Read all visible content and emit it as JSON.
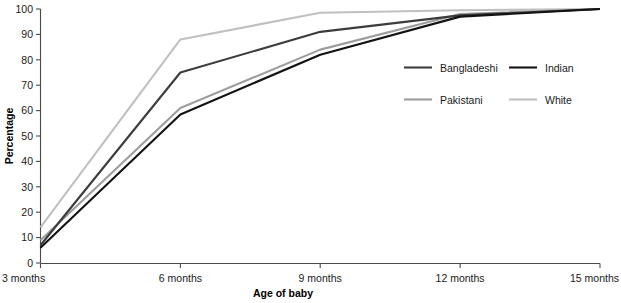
{
  "chart_data": {
    "type": "line",
    "title": "",
    "xlabel": "Age of baby",
    "ylabel": "Percentage",
    "x": [
      "3 months",
      "6 months",
      "9 months",
      "12 months",
      "15 months"
    ],
    "categories": [
      "3 months",
      "6 months",
      "9 months",
      "12 months",
      "15 months"
    ],
    "xtick_labels": [
      "3 months",
      "6 months",
      "9 months",
      "12 months",
      "15 months"
    ],
    "ytick_labels": [
      "0",
      "10",
      "20",
      "30",
      "40",
      "50",
      "60",
      "70",
      "80",
      "90",
      "100"
    ],
    "ylim": [
      0,
      100
    ],
    "ytick_step": 10,
    "grid": false,
    "legend_position": "center-right",
    "series": [
      {
        "name": "Bangladeshi",
        "color": "#3c3c3c",
        "values": [
          7,
          75,
          91,
          97.5,
          100
        ]
      },
      {
        "name": "Indian",
        "color": "#131313",
        "values": [
          6,
          58.5,
          82,
          97,
          100
        ]
      },
      {
        "name": "Pakistani",
        "color": "#9d9d9d",
        "values": [
          9,
          61,
          84,
          98,
          100
        ]
      },
      {
        "name": "White",
        "color": "#c0c0c0",
        "values": [
          14,
          88,
          98.5,
          99.5,
          100
        ]
      }
    ]
  },
  "axes": {
    "y_title": "Percentage",
    "x_title": "Age of baby"
  },
  "legend": {
    "entries": [
      {
        "label": "Bangladeshi",
        "color": "#3c3c3c"
      },
      {
        "label": "Indian",
        "color": "#131313"
      },
      {
        "label": "Pakistani",
        "color": "#9d9d9d"
      },
      {
        "label": "White",
        "color": "#c0c0c0"
      }
    ]
  },
  "colors": {
    "axis": "#4a4a4a",
    "text": "#1a1a1a",
    "background": "#ffffff"
  }
}
